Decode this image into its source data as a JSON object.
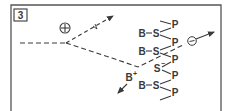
{
  "panel": {
    "number_label": "3"
  },
  "symbols": {
    "positive_charge": "+",
    "negative_charge": "−"
  },
  "chain": {
    "rows": [
      {
        "left": "B",
        "center": "S",
        "y": 33
      },
      {
        "left": "B",
        "center": "S",
        "y": 51
      },
      {
        "left": "",
        "center": "S",
        "charge": "−",
        "y": 68
      },
      {
        "left": "B",
        "center": "S",
        "y": 85
      }
    ],
    "p_labels": [
      "P",
      "P",
      "P",
      "P",
      "P",
      "P"
    ]
  },
  "released_ion": {
    "label": "B",
    "charge": "+"
  },
  "colors": {
    "stroke": "#3a3a3a",
    "frame": "#555555",
    "background": "#ffffff"
  }
}
